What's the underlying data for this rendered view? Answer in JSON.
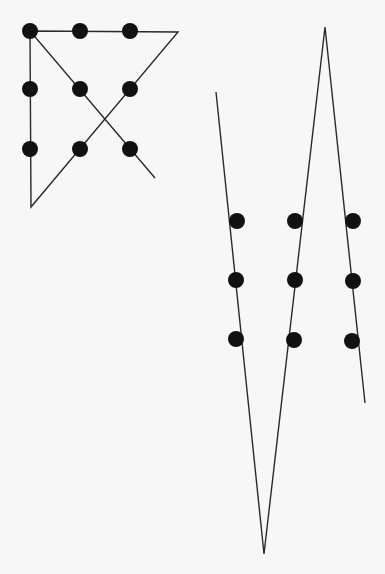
{
  "colors": {
    "background": "#f7f7f7",
    "ink": "#111111",
    "line": "#2a2a2a"
  },
  "puzzles": [
    {
      "name": "four-line-solution",
      "grid": "3x3",
      "line_count": 4
    },
    {
      "name": "three-line-solution",
      "grid": "3x3",
      "line_count": 3
    }
  ]
}
